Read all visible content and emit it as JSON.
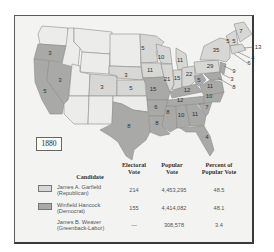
{
  "map": {
    "year": "1880",
    "colors": {
      "republican": "#d7d7d5",
      "democrat": "#a9a9a7",
      "unassigned_territory": "#ececea",
      "border": "#8d8d8b",
      "background": "#f3f3f1"
    },
    "state_labels": [
      {
        "state": "OR",
        "votes": "3",
        "party": "Democrat"
      },
      {
        "state": "NV",
        "votes": "3",
        "party": "Democrat"
      },
      {
        "state": "CA",
        "votes": "5",
        "party": "Democrat (split)"
      },
      {
        "state": "CO",
        "votes": "3",
        "party": "Republican"
      },
      {
        "state": "NE",
        "votes": "3",
        "party": "Republican"
      },
      {
        "state": "KS",
        "votes": "5",
        "party": "Republican"
      },
      {
        "state": "MN",
        "votes": "5",
        "party": "Republican"
      },
      {
        "state": "IA",
        "votes": "11",
        "party": "Republican"
      },
      {
        "state": "MO",
        "votes": "15",
        "party": "Democrat"
      },
      {
        "state": "AR",
        "votes": "6",
        "party": "Democrat"
      },
      {
        "state": "TX",
        "votes": "8",
        "party": "Democrat"
      },
      {
        "state": "LA",
        "votes": "8",
        "party": "Democrat"
      },
      {
        "state": "WI",
        "votes": "10",
        "party": "Republican"
      },
      {
        "state": "MI",
        "votes": "11",
        "party": "Republican"
      },
      {
        "state": "IL",
        "votes": "21",
        "party": "Republican"
      },
      {
        "state": "IN",
        "votes": "15",
        "party": "Republican"
      },
      {
        "state": "OH",
        "votes": "22",
        "party": "Republican"
      },
      {
        "state": "KY",
        "votes": "12",
        "party": "Democrat"
      },
      {
        "state": "TN",
        "votes": "12",
        "party": "Democrat"
      },
      {
        "state": "MS",
        "votes": "8",
        "party": "Democrat"
      },
      {
        "state": "AL",
        "votes": "10",
        "party": "Democrat"
      },
      {
        "state": "GA",
        "votes": "11",
        "party": "Democrat"
      },
      {
        "state": "FL",
        "votes": "4",
        "party": "Democrat"
      },
      {
        "state": "SC",
        "votes": "7",
        "party": "Democrat"
      },
      {
        "state": "NC",
        "votes": "10",
        "party": "Democrat"
      },
      {
        "state": "VA",
        "votes": "11",
        "party": "Democrat"
      },
      {
        "state": "WV",
        "votes": "5",
        "party": "Democrat"
      },
      {
        "state": "PA",
        "votes": "29",
        "party": "Republican"
      },
      {
        "state": "NY",
        "votes": "35",
        "party": "Republican"
      },
      {
        "state": "VT",
        "votes": "5",
        "party": "Republican"
      },
      {
        "state": "NH",
        "votes": "5",
        "party": "Republican"
      },
      {
        "state": "ME",
        "votes": "7",
        "party": "Republican"
      },
      {
        "state": "MA",
        "votes": "13",
        "party": "Republican"
      },
      {
        "state": "RI",
        "votes": "4",
        "party": "Republican"
      },
      {
        "state": "CT",
        "votes": "6",
        "party": "Republican"
      },
      {
        "state": "NJ",
        "votes": "9",
        "party": "Democrat"
      },
      {
        "state": "DE",
        "votes": "3",
        "party": "Democrat"
      },
      {
        "state": "MD",
        "votes": "8",
        "party": "Democrat"
      }
    ]
  },
  "table": {
    "headers": {
      "candidate": "Candidate",
      "electoral_1": "Electoral",
      "electoral_2": "Vote",
      "popular_1": "Popular",
      "popular_2": "Vote",
      "percent_1": "Percent of",
      "percent_2": "Popular Vote"
    },
    "rows": [
      {
        "name": "James A. Garfield",
        "party": "(Republican)",
        "electoral": "214",
        "popular": "4,453,295",
        "percent": "48.5",
        "swatch": "republican"
      },
      {
        "name": "Winfield Hancock",
        "party": "(Democrat)",
        "electoral": "155",
        "popular": "4,414,082",
        "percent": "48.1",
        "swatch": "democrat"
      },
      {
        "name": "James B. Weaver",
        "party": "(Greenback-Labor)",
        "electoral": "—",
        "popular": "308,578",
        "percent": "3.4",
        "swatch": "none"
      }
    ]
  }
}
